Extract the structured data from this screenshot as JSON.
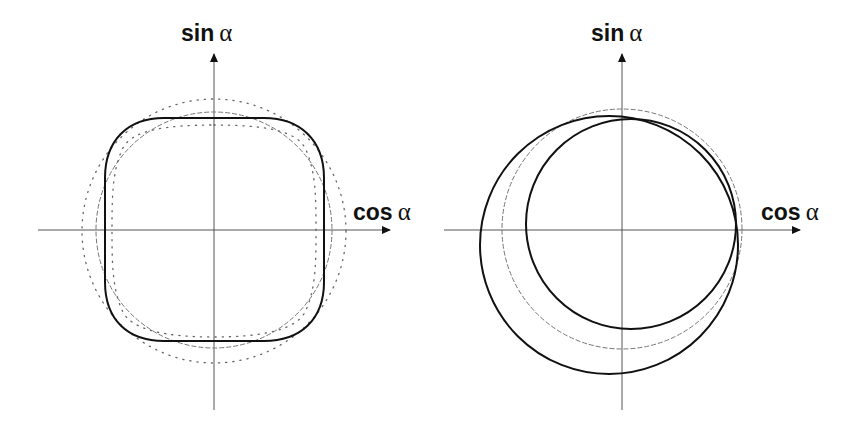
{
  "panels": [
    {
      "id": "left",
      "y_label": {
        "fn": "sin",
        "var": "α"
      },
      "x_label": {
        "fn": "cos",
        "var": "α"
      },
      "origin": [
        214,
        230
      ],
      "curves": [
        {
          "name": "reference-circle",
          "style": "dashed",
          "shape": "circle",
          "center": [
            214,
            230
          ],
          "radius": 118
        },
        {
          "name": "outer-dotted-circle",
          "style": "dotted",
          "shape": "circle",
          "center": [
            214,
            231
          ],
          "radius": 132
        },
        {
          "name": "inner-dotted-curve",
          "style": "dotted",
          "shape": "superellipse",
          "half_width": 100,
          "half_height": 104
        },
        {
          "name": "squircle",
          "style": "solid-thick",
          "shape": "rounded-square",
          "half_width": 110,
          "half_height": 111,
          "corner_radius": 55
        }
      ]
    },
    {
      "id": "right",
      "y_label": {
        "fn": "sin",
        "var": "α"
      },
      "x_label": {
        "fn": "cos",
        "var": "α"
      },
      "origin": [
        622,
        230
      ],
      "curves": [
        {
          "name": "reference-circle",
          "style": "dashed",
          "shape": "circle",
          "center": [
            622,
            229
          ],
          "radius": 120
        },
        {
          "name": "large-offset-circle",
          "style": "solid-thick",
          "shape": "circle",
          "center": [
            609,
            245
          ],
          "radius": 129
        },
        {
          "name": "small-offset-circle",
          "style": "solid-thick",
          "shape": "circle",
          "center": [
            631,
            224
          ],
          "radius": 105
        }
      ]
    }
  ],
  "colors": {
    "axis": "#555555",
    "curve": "#111111",
    "dashed": "#777777",
    "dotted": "#666666"
  }
}
